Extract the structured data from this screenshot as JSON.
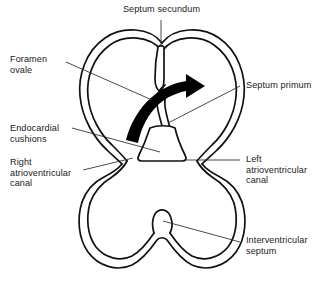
{
  "figure": {
    "name": "embryonic-heart-septation-diagram",
    "background_color": "#ffffff",
    "line_color": "#111111",
    "arrow_color": "#000000"
  },
  "labels": [
    {
      "id": "septum-secundum",
      "text": "Septum secundum",
      "position": "top-center",
      "align": "center",
      "x": 117,
      "y": 4
    },
    {
      "id": "foramen-ovale",
      "text": "Foramen\novale",
      "position": "upper-left",
      "align": "left",
      "x": 10,
      "y": 54
    },
    {
      "id": "septum-primum",
      "text": "Septum primum",
      "position": "right",
      "align": "left",
      "x": 243,
      "y": 80
    },
    {
      "id": "endocardial-cushions",
      "text": "Endocardial\ncushions",
      "position": "mid-left",
      "align": "left",
      "x": 10,
      "y": 124
    },
    {
      "id": "right-atrioventricular-canal",
      "text": "Right\natrioventricular\ncanal",
      "position": "lower-left",
      "align": "left",
      "x": 10,
      "y": 158
    },
    {
      "id": "left-atrioventricular-canal",
      "text": "Left\natrioventricular\ncanal",
      "position": "lower-right",
      "align": "left",
      "x": 243,
      "y": 155
    },
    {
      "id": "interventricular-septum",
      "text": "Interventricular\nseptum",
      "position": "bottom-right",
      "align": "left",
      "x": 243,
      "y": 235
    }
  ],
  "structures": [
    {
      "id": "atrial-chamber",
      "name": "Common atrium (double-walled heart-shaped chamber)"
    },
    {
      "id": "ventricular-chamber",
      "name": "Common ventricle (double-walled rounded chamber)"
    },
    {
      "id": "septum-secundum-flap",
      "name": "Septum secundum descending from atrial roof"
    },
    {
      "id": "septum-primum-flap",
      "name": "Septum primum thin curved flap"
    },
    {
      "id": "endocardial-cushion-mass",
      "name": "Fused endocardial cushions at atrioventricular junction"
    },
    {
      "id": "interventricular-septum-ridge",
      "name": "Interventricular septum ridge rising from ventricular floor"
    },
    {
      "id": "blood-flow-arrow",
      "name": "Blood flow arrow through foramen ovale, right to left atrium"
    }
  ]
}
